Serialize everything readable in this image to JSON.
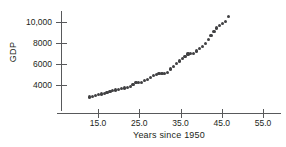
{
  "chart_data": {
    "type": "scatter",
    "title": "",
    "xlabel": "Years since 1950",
    "ylabel": "GDP",
    "xlim": [
      12,
      56
    ],
    "ylim": [
      2400,
      11000
    ],
    "grid": false,
    "legend": "none",
    "marker_color": "#404042",
    "axis_color": "#58595b",
    "xticks": [
      {
        "value": 15,
        "label": "15.0"
      },
      {
        "value": 25,
        "label": "25.0"
      },
      {
        "value": 35,
        "label": "35.0"
      },
      {
        "value": 45,
        "label": "45.0"
      },
      {
        "value": 55,
        "label": "55.0"
      }
    ],
    "yticks": [
      {
        "value": 4000,
        "label": "4000"
      },
      {
        "value": 6000,
        "label": "6000"
      },
      {
        "value": 8000,
        "label": "8000"
      },
      {
        "value": 10000,
        "label": "10,000"
      }
    ],
    "x": [
      13,
      14,
      15,
      16,
      17,
      18,
      19,
      20,
      21,
      22,
      23,
      24,
      25,
      26,
      27,
      28,
      29,
      30,
      31,
      32,
      33,
      34,
      35,
      36,
      37,
      38,
      39,
      40,
      41,
      42,
      43,
      44,
      45,
      46,
      47,
      48,
      49,
      50,
      51,
      52,
      53,
      54,
      55
    ],
    "y": [
      2860,
      2950,
      3030,
      3120,
      3200,
      3280,
      3400,
      3480,
      3560,
      3640,
      3700,
      3780,
      3900,
      4080,
      4230,
      4230,
      4240,
      4440,
      4620,
      4760,
      4950,
      5060,
      5100,
      5090,
      5280,
      5620,
      5880,
      6100,
      6320,
      6560,
      6760,
      7000,
      7010,
      7270,
      7480,
      7700,
      8000,
      8400,
      8790,
      9100,
      9450,
      9700,
      9900,
      10100,
      10500
    ],
    "points": [
      {
        "x": 13.0,
        "y": 2860
      },
      {
        "x": 13.7,
        "y": 2930
      },
      {
        "x": 14.4,
        "y": 3000
      },
      {
        "x": 15.1,
        "y": 3080
      },
      {
        "x": 15.8,
        "y": 3150
      },
      {
        "x": 16.5,
        "y": 3220
      },
      {
        "x": 17.2,
        "y": 3300
      },
      {
        "x": 17.9,
        "y": 3380
      },
      {
        "x": 18.6,
        "y": 3450
      },
      {
        "x": 19.3,
        "y": 3520
      },
      {
        "x": 20.0,
        "y": 3600
      },
      {
        "x": 20.7,
        "y": 3660
      },
      {
        "x": 21.4,
        "y": 3720
      },
      {
        "x": 22.1,
        "y": 3790
      },
      {
        "x": 22.8,
        "y": 3870
      },
      {
        "x": 23.5,
        "y": 4050
      },
      {
        "x": 24.2,
        "y": 4220
      },
      {
        "x": 24.9,
        "y": 4230
      },
      {
        "x": 25.6,
        "y": 4250
      },
      {
        "x": 26.3,
        "y": 4400
      },
      {
        "x": 27.0,
        "y": 4560
      },
      {
        "x": 27.7,
        "y": 4700
      },
      {
        "x": 28.4,
        "y": 4880
      },
      {
        "x": 29.1,
        "y": 5020
      },
      {
        "x": 29.8,
        "y": 5090
      },
      {
        "x": 30.5,
        "y": 5100
      },
      {
        "x": 31.2,
        "y": 5080
      },
      {
        "x": 31.9,
        "y": 5200
      },
      {
        "x": 32.6,
        "y": 5520
      },
      {
        "x": 33.3,
        "y": 5800
      },
      {
        "x": 34.0,
        "y": 6040
      },
      {
        "x": 34.7,
        "y": 6280
      },
      {
        "x": 35.4,
        "y": 6500
      },
      {
        "x": 36.1,
        "y": 6720
      },
      {
        "x": 36.8,
        "y": 6960
      },
      {
        "x": 37.5,
        "y": 7000
      },
      {
        "x": 38.2,
        "y": 7010
      },
      {
        "x": 38.9,
        "y": 7230
      },
      {
        "x": 39.6,
        "y": 7450
      },
      {
        "x": 40.3,
        "y": 7680
      },
      {
        "x": 41.0,
        "y": 7980
      },
      {
        "x": 41.7,
        "y": 8350
      },
      {
        "x": 42.4,
        "y": 8740
      },
      {
        "x": 43.1,
        "y": 9060
      },
      {
        "x": 43.8,
        "y": 9420
      },
      {
        "x": 44.5,
        "y": 9680
      },
      {
        "x": 45.2,
        "y": 9880
      },
      {
        "x": 45.9,
        "y": 10080
      },
      {
        "x": 46.6,
        "y": 10500
      }
    ]
  },
  "chart": {
    "ylabel": "GDP",
    "xlabel": "Years since 1950"
  }
}
